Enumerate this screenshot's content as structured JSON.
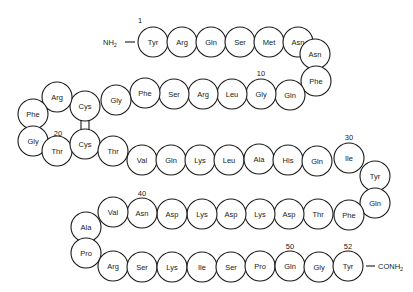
{
  "diagram": {
    "type": "peptide-sequence",
    "n_terminus": "NH2",
    "c_terminus": "CONH2",
    "colors": {
      "stroke": "#1a1a1a",
      "fill": "#ffffff",
      "background": "#ffffff"
    },
    "residues": [
      {
        "index": 1,
        "name": "Tyr",
        "x": 153,
        "y": 42
      },
      {
        "index": 2,
        "name": "Arg",
        "x": 182,
        "y": 42
      },
      {
        "index": 3,
        "name": "Gln",
        "x": 211,
        "y": 42
      },
      {
        "index": 4,
        "name": "Ser",
        "x": 240,
        "y": 42
      },
      {
        "index": 5,
        "name": "Met",
        "x": 269,
        "y": 42
      },
      {
        "index": 6,
        "name": "Asn",
        "x": 298,
        "y": 42
      },
      {
        "index": 7,
        "name": "Asn",
        "x": 315,
        "y": 54
      },
      {
        "index": 8,
        "name": "Phe",
        "x": 316,
        "y": 81
      },
      {
        "index": 9,
        "name": "Gln",
        "x": 290,
        "y": 95
      },
      {
        "index": 10,
        "name": "Gly",
        "x": 261,
        "y": 94
      },
      {
        "index": 11,
        "name": "Leu",
        "x": 232,
        "y": 94
      },
      {
        "index": 12,
        "name": "Arg",
        "x": 203,
        "y": 94
      },
      {
        "index": 13,
        "name": "Ser",
        "x": 174,
        "y": 94
      },
      {
        "index": 14,
        "name": "Phe",
        "x": 145,
        "y": 93
      },
      {
        "index": 15,
        "name": "Gly",
        "x": 116,
        "y": 100
      },
      {
        "index": 16,
        "name": "Cys",
        "x": 85,
        "y": 106
      },
      {
        "index": 17,
        "name": "Arg",
        "x": 57,
        "y": 97
      },
      {
        "index": 18,
        "name": "Phe",
        "x": 33,
        "y": 114
      },
      {
        "index": 19,
        "name": "Gly",
        "x": 33,
        "y": 141
      },
      {
        "index": 20,
        "name": "Thr",
        "x": 57,
        "y": 151
      },
      {
        "index": 21,
        "name": "Cys",
        "x": 85,
        "y": 144
      },
      {
        "index": 22,
        "name": "Thr",
        "x": 113,
        "y": 151
      },
      {
        "index": 23,
        "name": "Val",
        "x": 142,
        "y": 160
      },
      {
        "index": 24,
        "name": "Gln",
        "x": 171,
        "y": 160
      },
      {
        "index": 25,
        "name": "Lys",
        "x": 200,
        "y": 160
      },
      {
        "index": 26,
        "name": "Leu",
        "x": 229,
        "y": 160
      },
      {
        "index": 27,
        "name": "Ala",
        "x": 259,
        "y": 159
      },
      {
        "index": 28,
        "name": "His",
        "x": 288,
        "y": 160
      },
      {
        "index": 29,
        "name": "Gln",
        "x": 317,
        "y": 161
      },
      {
        "index": 30,
        "name": "Ile",
        "x": 349,
        "y": 158
      },
      {
        "index": 31,
        "name": "Tyr",
        "x": 375,
        "y": 176
      },
      {
        "index": 32,
        "name": "Gln",
        "x": 375,
        "y": 203
      },
      {
        "index": 33,
        "name": "Phe",
        "x": 349,
        "y": 215
      },
      {
        "index": 34,
        "name": "Thr",
        "x": 318,
        "y": 214
      },
      {
        "index": 35,
        "name": "Asp",
        "x": 289,
        "y": 214
      },
      {
        "index": 36,
        "name": "Lys",
        "x": 260,
        "y": 214
      },
      {
        "index": 37,
        "name": "Asp",
        "x": 231,
        "y": 214
      },
      {
        "index": 38,
        "name": "Lys",
        "x": 202,
        "y": 214
      },
      {
        "index": 39,
        "name": "Asp",
        "x": 172,
        "y": 214
      },
      {
        "index": 40,
        "name": "Asn",
        "x": 142,
        "y": 213
      },
      {
        "index": 41,
        "name": "Val",
        "x": 113,
        "y": 212
      },
      {
        "index": 42,
        "name": "Ala",
        "x": 86,
        "y": 227
      },
      {
        "index": 43,
        "name": "Pro",
        "x": 86,
        "y": 253
      },
      {
        "index": 44,
        "name": "Arg",
        "x": 113,
        "y": 266
      },
      {
        "index": 45,
        "name": "Ser",
        "x": 142,
        "y": 267
      },
      {
        "index": 46,
        "name": "Lys",
        "x": 172,
        "y": 267
      },
      {
        "index": 47,
        "name": "Ile",
        "x": 202,
        "y": 267
      },
      {
        "index": 48,
        "name": "Ser",
        "x": 231,
        "y": 267
      },
      {
        "index": 49,
        "name": "Pro",
        "x": 260,
        "y": 266
      },
      {
        "index": 50,
        "name": "Gln",
        "x": 290,
        "y": 266
      },
      {
        "index": 51,
        "name": "Gly",
        "x": 319,
        "y": 267
      },
      {
        "index": 52,
        "name": "Tyr",
        "x": 348,
        "y": 266
      }
    ],
    "position_labels": [
      {
        "text": "1",
        "x": 140,
        "y": 23
      },
      {
        "text": "10",
        "x": 261,
        "y": 76
      },
      {
        "text": "20",
        "x": 58,
        "y": 136
      },
      {
        "text": "30",
        "x": 349,
        "y": 140
      },
      {
        "text": "40",
        "x": 142,
        "y": 196
      },
      {
        "text": "50",
        "x": 290,
        "y": 249
      },
      {
        "text": "52",
        "x": 348,
        "y": 249
      }
    ],
    "disulfide_bond": {
      "from": 16,
      "to": 21,
      "label": "Cys16–Cys21"
    }
  }
}
